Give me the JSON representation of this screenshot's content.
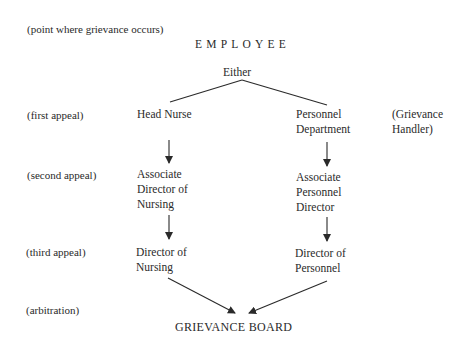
{
  "diagram": {
    "origin_label": "(point where grievance occurs)",
    "origin": "EMPLOYEE",
    "branch": "Either",
    "row_labels": [
      "(first appeal)",
      "(second appeal)",
      "(third appeal)",
      "(arbitration)"
    ],
    "left_path": [
      [
        "Head Nurse"
      ],
      [
        "Associate",
        "Director of",
        "Nursing"
      ],
      [
        "Director of",
        "Nursing"
      ]
    ],
    "right_path": [
      [
        "Personnel",
        "Department"
      ],
      [
        "Associate",
        "Personnel",
        "Director"
      ],
      [
        "Director of",
        "Personnel"
      ]
    ],
    "right_annotation": [
      "(Grievance",
      "Handler)"
    ],
    "destination": "GRIEVANCE BOARD",
    "line_color": "#2a2a2a"
  }
}
